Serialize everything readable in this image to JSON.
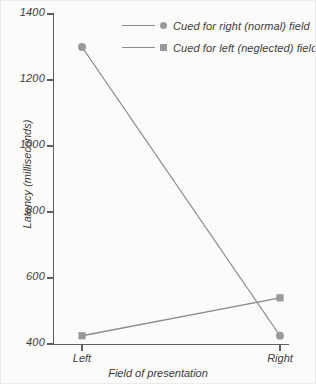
{
  "chart_data": {
    "type": "line",
    "title": "",
    "xlabel": "Field of presentation",
    "ylabel": "Latency (milliseconds)",
    "categories": [
      "Left",
      "Right"
    ],
    "x_tick_labels": [
      "Left",
      "Right"
    ],
    "y_tick_labels": [
      "400",
      "600",
      "800",
      "1000",
      "1200",
      "1400"
    ],
    "y_ticks": [
      400,
      600,
      800,
      1000,
      1200,
      1400
    ],
    "ylim": [
      400,
      1400
    ],
    "grid": false,
    "legend_position": "top-right",
    "series": [
      {
        "name": "Cued for right (normal) field",
        "marker": "circle",
        "values": [
          1300,
          425
        ]
      },
      {
        "name": "Cued for left (neglected) field",
        "marker": "square",
        "values": [
          425,
          540
        ]
      }
    ]
  },
  "legend": {
    "items": [
      {
        "label": "Cued for right (normal) field",
        "marker": "circle"
      },
      {
        "label": "Cued for left (neglected) field",
        "marker": "square"
      }
    ]
  },
  "axes": {
    "x_title": "Field of presentation",
    "y_title": "Latency (milliseconds)"
  },
  "colors": {
    "line": "#8c8c8c",
    "marker": "#9a9a9a",
    "axis": "#5d5d5d",
    "text": "#3c3c3c",
    "background": "#fbfbfa"
  }
}
